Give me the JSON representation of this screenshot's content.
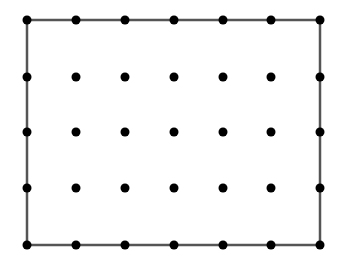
{
  "diagram": {
    "type": "dot-grid-rectangle",
    "columns_x": [
      27,
      76,
      125,
      174,
      223,
      271,
      320
    ],
    "rows_y": [
      20,
      77,
      132,
      188,
      245
    ],
    "rectangle": {
      "x1": 27,
      "y1": 20,
      "x2": 320,
      "y2": 245,
      "stroke": "#555555",
      "stroke_width": 2.5
    },
    "dot_color": "#000000",
    "dot_radius": 4.5,
    "grid_size": {
      "cols": 7,
      "rows": 5
    }
  }
}
